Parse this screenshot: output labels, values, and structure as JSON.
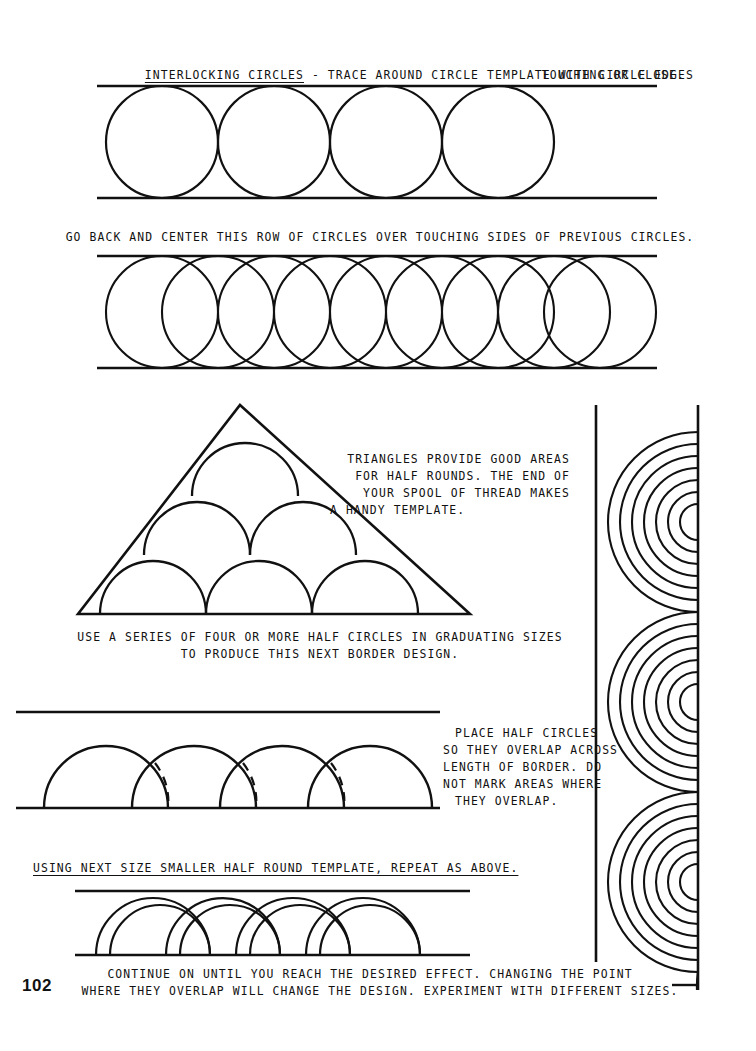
{
  "page": {
    "number": "102"
  },
  "sections": {
    "heading": {
      "underlined_term": "INTERLOCKING CIRCLES",
      "line1_rest": " - TRACE AROUND CIRCLE TEMPLATE WITH CIRCLE EDGES",
      "line2": "TOUCHING OR CLOSE."
    },
    "row2_caption": "GO BACK AND CENTER THIS ROW OF CIRCLES OVER TOUCHING SIDES OF PREVIOUS CIRCLES.",
    "triangle_note": {
      "line1": "TRIANGLES PROVIDE GOOD AREAS",
      "line2": "FOR HALF ROUNDS. THE END OF",
      "line3": "YOUR SPOOL OF THREAD MAKES",
      "line4": "A HANDY TEMPLATE."
    },
    "series_caption": {
      "line1": "USE A SERIES OF FOUR OR MORE HALF CIRCLES IN GRADUATING SIZES",
      "line2": "TO PRODUCE THIS NEXT BORDER DESIGN."
    },
    "overlap_note": {
      "line1": "PLACE HALF CIRCLES",
      "line2": "SO THEY OVERLAP ACROSS",
      "line3": "LENGTH OF BORDER. DO",
      "line4": "NOT MARK AREAS WHERE",
      "line5": "THEY OVERLAP."
    },
    "smaller_template_caption": "USING NEXT SIZE SMALLER HALF ROUND TEMPLATE, REPEAT AS ABOVE.",
    "closing_caption": {
      "line1": "CONTINUE ON UNTIL YOU REACH THE DESIRED EFFECT. CHANGING THE POINT",
      "line2": "WHERE THEY OVERLAP WILL CHANGE THE DESIGN. EXPERIMENT WITH DIFFERENT SIZES."
    }
  },
  "figures": {
    "row1": {
      "name": "tangent-circles-row",
      "circles": 4,
      "radius": 56
    },
    "row2": {
      "name": "overlapping-circles-row",
      "circles": 9,
      "radius": 56
    },
    "triangle": {
      "name": "triangle-half-rounds",
      "rows": [
        3,
        2,
        1
      ]
    },
    "border_large": {
      "name": "overlapping-half-circles-border",
      "arcs": 4
    },
    "border_small": {
      "name": "nested-half-round-border",
      "arcs": 4
    },
    "side_panel": {
      "name": "concentric-arc-border-strip",
      "fans": 3,
      "rings_per_fan": 8
    }
  },
  "colors": {
    "ink": "#111111",
    "paper": "#ffffff"
  }
}
